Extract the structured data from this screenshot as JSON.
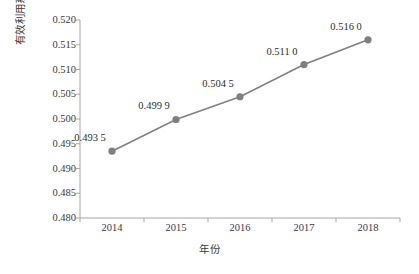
{
  "chart_data": {
    "type": "line",
    "title": "",
    "subtitle": "",
    "xlabel": "年份",
    "ylabel": "有效利用系数",
    "categories": [
      "2014",
      "2015",
      "2016",
      "2017",
      "2018"
    ],
    "values": [
      0.4935,
      0.4999,
      0.5045,
      0.511,
      0.516
    ],
    "point_labels": [
      "0.493 5",
      "0.499 9",
      "0.504 5",
      "0.511 0",
      "0.516 0"
    ],
    "ylim": [
      0.48,
      0.52
    ],
    "ytick_labels": [
      "0.520",
      "0.515",
      "0.510",
      "0.505",
      "0.500",
      "0.495",
      "0.490",
      "0.485",
      "0.480"
    ],
    "ytick_values": [
      0.52,
      0.515,
      0.51,
      0.505,
      0.5,
      0.495,
      0.49,
      0.485,
      0.48
    ],
    "grid": false,
    "legend": false,
    "legend_position": "none",
    "series": [
      {
        "name": "有效利用系数",
        "values": [
          0.4935,
          0.4999,
          0.5045,
          0.511,
          0.516
        ]
      }
    ],
    "colors": {
      "line": "#808080",
      "marker": "#7f7f7f",
      "axis": "#a6a6a6",
      "text": "#3a3a3a"
    }
  },
  "axes": {
    "y_title": "有效利用系数",
    "x_title": "年份"
  }
}
